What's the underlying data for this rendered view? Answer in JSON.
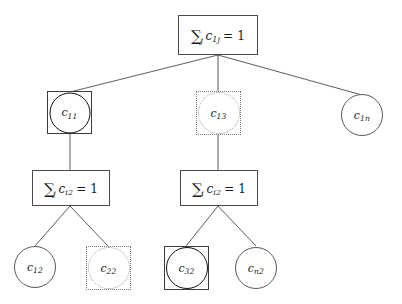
{
  "figure": {
    "kind": "tree-diagram",
    "background_color": "#ffffff",
    "stroke_color": "#4a4a4a",
    "emphasis_color": "#111111",
    "dotted_color": "#8a8a8a"
  },
  "nodes": {
    "root": {
      "id": "root",
      "style": "equation-box",
      "sigma": "∑",
      "sigma_index": "j",
      "variable": "c",
      "variable_sub": "1j",
      "equals": "= 1",
      "full_text": "∑j c1j = 1"
    },
    "c11": {
      "id": "c11",
      "style": "boxed-bold-circle",
      "variable": "c",
      "sub": "11",
      "full_text": "c11"
    },
    "c13": {
      "id": "c13",
      "style": "dotted-box-circle",
      "variable": "c",
      "sub": "13",
      "full_text": "c13"
    },
    "c1n": {
      "id": "c1n",
      "style": "plain-circle",
      "variable": "c",
      "sub": "1n",
      "full_text": "c1n"
    },
    "box_left": {
      "id": "box_left",
      "style": "equation-box",
      "sigma": "∑",
      "sigma_index": "j",
      "variable": "c",
      "variable_sub": "i2",
      "equals": "= 1",
      "full_text": "∑j ci2 = 1"
    },
    "box_mid": {
      "id": "box_mid",
      "style": "equation-box",
      "sigma": "∑",
      "sigma_index": "i",
      "variable": "c",
      "variable_sub": "i2",
      "equals": "= 1",
      "full_text": "∑i ci2 = 1"
    },
    "c12": {
      "id": "c12",
      "style": "plain-circle",
      "variable": "c",
      "sub": "12",
      "full_text": "c12"
    },
    "c22": {
      "id": "c22",
      "style": "dotted-box-circle",
      "variable": "c",
      "sub": "22",
      "full_text": "c22"
    },
    "c32": {
      "id": "c32",
      "style": "boxed-bold-circle",
      "variable": "c",
      "sub": "32",
      "full_text": "c32"
    },
    "cn2": {
      "id": "cn2",
      "style": "plain-circle",
      "variable": "c",
      "sub": "n2",
      "full_text": "cn2"
    }
  },
  "edges": [
    {
      "from": "root",
      "to": "c11"
    },
    {
      "from": "root",
      "to": "c13"
    },
    {
      "from": "root",
      "to": "c1n"
    },
    {
      "from": "c11",
      "to": "box_left"
    },
    {
      "from": "c13",
      "to": "box_mid"
    },
    {
      "from": "box_left",
      "to": "c12"
    },
    {
      "from": "box_left",
      "to": "c22"
    },
    {
      "from": "box_mid",
      "to": "c32"
    },
    {
      "from": "box_mid",
      "to": "cn2"
    }
  ]
}
